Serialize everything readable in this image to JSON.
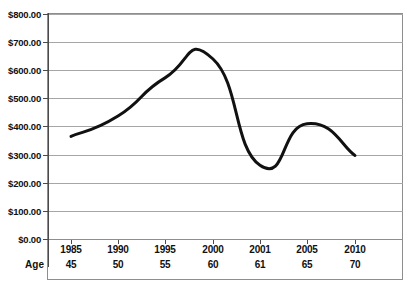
{
  "chart_data": {
    "type": "line",
    "title": "",
    "subtitle": "",
    "xlabel": "",
    "ylabel": "",
    "categories": [
      "1985",
      "1990",
      "1995",
      "2000",
      "2001",
      "2005",
      "2010"
    ],
    "secondary_categories": [
      "45",
      "50",
      "55",
      "60",
      "61",
      "65",
      "70"
    ],
    "secondary_axis_label": "Age",
    "values": [
      365,
      437,
      573,
      640,
      262,
      410,
      297
    ],
    "series": [
      {
        "name": "",
        "values": [
          365,
          437,
          573,
          640,
          262,
          410,
          297
        ]
      }
    ],
    "ylim": [
      0,
      800
    ],
    "ytick_values": [
      0,
      100,
      200,
      300,
      400,
      500,
      600,
      700,
      800
    ],
    "ytick_labels": [
      "$0.00",
      "$100.00",
      "$200.00",
      "$300.00",
      "$400.00",
      "$500.00",
      "$600.00",
      "$700.00",
      "$800.00"
    ],
    "grid": true,
    "grid_axis": "y",
    "legend": false,
    "legend_position": "none",
    "line_color": "#111111",
    "line_width": 3,
    "grid_color": "#a6a6a6",
    "axis_color": "#4a4a4a",
    "background_color": "#ffffff",
    "smoothing": true,
    "annotations": []
  },
  "figure": {
    "top_clipped_text": "",
    "frame_border_color": "#8e8e8e"
  }
}
